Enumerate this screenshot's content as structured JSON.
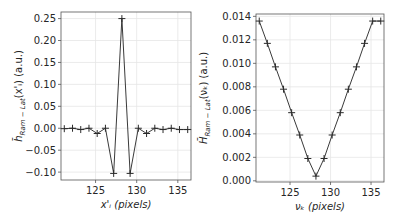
{
  "chart_data": [
    {
      "type": "line",
      "title": "",
      "xlabel": "x'_i  (pixels)",
      "ylabel": "h̄_Ram−Lat(x'_i)  (a.u.)",
      "xlim": [
        120.8,
        136.6
      ],
      "ylim": [
        -0.118,
        0.265
      ],
      "xticks": [
        125,
        130,
        135
      ],
      "xtick_labels": [
        "125",
        "130",
        "135"
      ],
      "yticks": [
        -0.1,
        -0.05,
        0.0,
        0.05,
        0.1,
        0.15,
        0.2,
        0.25
      ],
      "ytick_labels": [
        "−0.10",
        "−0.05",
        "0.00",
        "0.05",
        "0.10",
        "0.15",
        "0.20",
        "0.25"
      ],
      "grid": true,
      "marker": "+",
      "x": [
        121.2,
        122.2,
        123.2,
        124.2,
        125.2,
        126.2,
        127.2,
        128.2,
        129.2,
        130.2,
        131.2,
        132.2,
        133.2,
        134.2,
        135.2,
        136.2
      ],
      "values": [
        -0.001,
        0.0,
        -0.003,
        0.0,
        -0.012,
        0.0,
        -0.103,
        0.25,
        -0.103,
        0.0,
        -0.012,
        0.0,
        -0.003,
        0.0,
        -0.003,
        -0.003
      ]
    },
    {
      "type": "line",
      "title": "",
      "xlabel": "ν_k  (pixels)",
      "ylabel": "H̄_Ram−Lat(ν_k)  (a.u.)",
      "xlim": [
        120.8,
        136.6
      ],
      "ylim": [
        -0.0001,
        0.0142
      ],
      "xticks": [
        125,
        130,
        135
      ],
      "xtick_labels": [
        "125",
        "130",
        "135"
      ],
      "yticks": [
        0.0,
        0.002,
        0.004,
        0.006,
        0.008,
        0.01,
        0.012,
        0.014
      ],
      "ytick_labels": [
        "0.000",
        "0.002",
        "0.004",
        "0.006",
        "0.008",
        "0.010",
        "0.012",
        "0.014"
      ],
      "grid": true,
      "marker": "+",
      "x": [
        121.2,
        122.2,
        123.2,
        124.2,
        125.2,
        126.2,
        127.2,
        128.2,
        129.2,
        130.2,
        131.2,
        132.2,
        133.2,
        134.2,
        135.2,
        136.2
      ],
      "values": [
        0.0136,
        0.0117,
        0.0097,
        0.0078,
        0.0058,
        0.0039,
        0.0019,
        0.0004,
        0.0019,
        0.0039,
        0.0058,
        0.0078,
        0.0097,
        0.0117,
        0.0136,
        0.0136
      ]
    }
  ],
  "panels": [
    {
      "ylabel_main": "h̄",
      "ylabel_sub": "Ram − Lat",
      "ylabel_arg": "(x'ᵢ)  (a.u.)",
      "xlabel": "x'ᵢ  (pixels)"
    },
    {
      "ylabel_main": "H̄",
      "ylabel_sub": "Ram − Lat",
      "ylabel_arg": "(νₖ)  (a.u.)",
      "xlabel": "νₖ  (pixels)"
    }
  ]
}
